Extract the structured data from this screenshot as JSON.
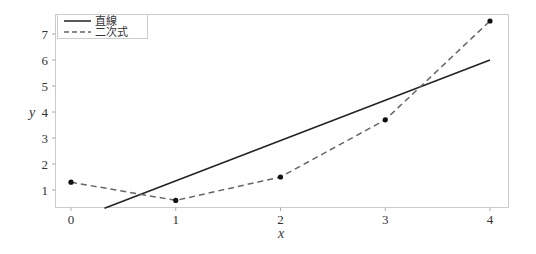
{
  "chart_data": {
    "type": "line",
    "title": "",
    "xlabel": "x",
    "ylabel": "y",
    "xlim": [
      -0.15,
      4.17
    ],
    "ylim": [
      0.35,
      7.77
    ],
    "grid": false,
    "legend_position": "upper left",
    "x_ticks": [
      0,
      1,
      2,
      3,
      4
    ],
    "y_ticks": [
      1,
      2,
      3,
      4,
      5,
      6,
      7
    ],
    "series": [
      {
        "name": "直線",
        "style": "solid",
        "color": "#222222",
        "x": [
          0.32,
          4
        ],
        "values": [
          0.3,
          6.0
        ]
      },
      {
        "name": "二次式",
        "style": "dashed",
        "color": "#666666",
        "markers": true,
        "x": [
          0,
          1,
          2,
          3,
          4
        ],
        "values": [
          1.3,
          0.6,
          1.5,
          3.7,
          7.5
        ]
      }
    ]
  },
  "legend": {
    "items": [
      {
        "label": "直線"
      },
      {
        "label": "二次式"
      }
    ]
  },
  "axes": {
    "xlabel": "x",
    "ylabel": "y",
    "x_tick_labels": [
      "0",
      "1",
      "2",
      "3",
      "4"
    ],
    "y_tick_labels": [
      "1",
      "2",
      "3",
      "4",
      "5",
      "6",
      "7"
    ]
  }
}
